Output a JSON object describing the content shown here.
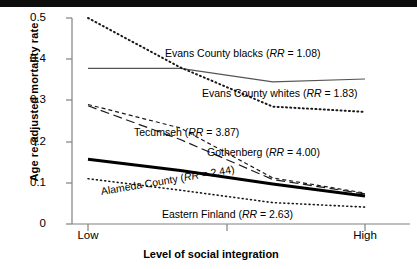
{
  "chart_data": {
    "type": "line",
    "title": "",
    "xlabel": "Level of social integration",
    "ylabel": "Age re-adjusted mortality rate",
    "ylim": [
      0,
      0.5
    ],
    "yticks": [
      "0",
      "0.1",
      "0.2",
      "0.3",
      "0.4",
      "0.5"
    ],
    "ytick_values": [
      0,
      0.1,
      0.2,
      0.3,
      0.4,
      0.5
    ],
    "xticks": [
      "Low",
      "",
      "High"
    ],
    "xtick_labels_visible": [
      "Low",
      "High"
    ],
    "grid": false,
    "legend": "inline-annotations",
    "x": [
      1,
      2,
      3,
      4
    ],
    "series": [
      {
        "name": "Evans County blacks",
        "rr_label": "RR = 1.08",
        "annotation": "Evans County blacks (RR = 1.08)",
        "style": "solid",
        "color": "#555555",
        "width": 1.2,
        "values": [
          0.378,
          0.378,
          0.345,
          0.352
        ]
      },
      {
        "name": "Evans County whites",
        "rr_label": "RR = 1.83",
        "annotation": "Evans County whites (RR = 1.83)",
        "style": "dotted",
        "color": "#1a1a1a",
        "width": 2.0,
        "values": [
          0.5,
          0.38,
          0.285,
          0.272
        ]
      },
      {
        "name": "Tecumseh",
        "rr_label": "RR =  3.87",
        "annotation": "Tecumseh (RR =  3.87)",
        "style": "dashed-short",
        "color": "#1a1a1a",
        "width": 1.2,
        "values": [
          0.29,
          0.233,
          0.112,
          0.075
        ]
      },
      {
        "name": "Gothenberg",
        "rr_label": "RR = 4.00",
        "annotation": "Gothenberg (RR = 4.00)",
        "style": "dashed-long",
        "color": "#1a1a1a",
        "width": 1.2,
        "values": [
          0.287,
          0.205,
          0.108,
          0.073
        ]
      },
      {
        "name": "Alameda County",
        "rr_label": "RR = 2.44",
        "annotation": "Alameda County (RR = 2.44)",
        "style": "solid-thick",
        "color": "#000000",
        "width": 3.0,
        "values": [
          0.157,
          0.13,
          0.097,
          0.068
        ]
      },
      {
        "name": "Eastern Finland",
        "rr_label": "RR = 2.63",
        "annotation": "Eastern Finland (RR = 2.63)",
        "style": "dotted",
        "color": "#1a1a1a",
        "width": 1.6,
        "values": [
          0.11,
          0.082,
          0.052,
          0.041
        ]
      }
    ],
    "annotations": [
      {
        "id": "ann-evans-blacks",
        "text_plain": "Evans County blacks (RR = 1.08)",
        "pre": "Evans County blacks (",
        "italic": "RR",
        "post": " = 1.08)"
      },
      {
        "id": "ann-evans-whites",
        "text_plain": "Evans County whites (RR = 1.83)",
        "pre": "Evans County whites (",
        "italic": "RR",
        "post": " = 1.83)"
      },
      {
        "id": "ann-tecumseh",
        "text_plain": "Tecumseh (RR =  3.87)",
        "pre": "Tecumseh (",
        "italic": "RR",
        "post": " =  3.87)"
      },
      {
        "id": "ann-gothenberg",
        "text_plain": "Gothenberg (RR = 4.00)",
        "pre": "Gothenberg (",
        "italic": "RR",
        "post": " = 4.00)"
      },
      {
        "id": "ann-alameda",
        "text_plain": "Alameda County (RR = 2.44)",
        "pre": "Alameda County (",
        "italic": "RR",
        "post": " = 2.44)"
      },
      {
        "id": "ann-eastern-finland",
        "text_plain": "Eastern Finland (RR = 2.63)",
        "pre": "Eastern Finland (",
        "italic": "RR",
        "post": " = 2.63)"
      }
    ]
  },
  "axis": {
    "y_title": "Age re-adjusted mortality rate",
    "x_title": "Level of social integration",
    "y_tick_0": "0",
    "y_tick_1": "0.1",
    "y_tick_2": "0.2",
    "y_tick_3": "0.3",
    "y_tick_4": "0.4",
    "y_tick_5": "0.5",
    "x_tick_low": "Low",
    "x_tick_high": "High"
  }
}
